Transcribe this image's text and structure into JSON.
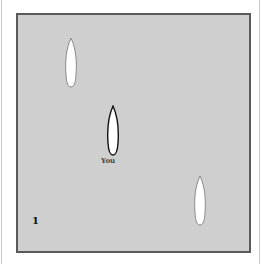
{
  "game": {
    "player_label": "You",
    "level_number": "1",
    "boats": [
      {
        "id": "opponent-1",
        "role": "opponent"
      },
      {
        "id": "player",
        "role": "player"
      },
      {
        "id": "opponent-2",
        "role": "opponent"
      }
    ]
  },
  "colors": {
    "sea": "#cfcfcf",
    "sea_border": "#5a5a5a",
    "boat_fill": "#ffffff",
    "opponent_outline": "#8a8a8a",
    "player_outline": "#111111"
  }
}
